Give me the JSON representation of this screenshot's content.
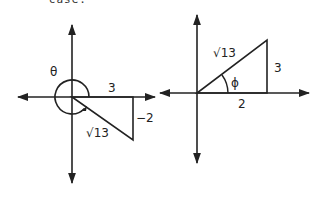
{
  "header": {
    "clipped_text": "·· case."
  },
  "left_diagram": {
    "angle_label": "θ",
    "adjacent_label": "3",
    "opposite_label": "−2",
    "hypotenuse_label": "√13"
  },
  "right_diagram": {
    "angle_label": "ϕ",
    "adjacent_label": "2",
    "opposite_label": "3",
    "hypotenuse_label": "√13"
  }
}
